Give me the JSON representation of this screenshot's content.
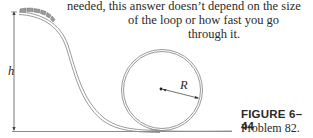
{
  "text": {
    "lines": [
      "needed, this answer doesn’t depend on the size",
      "of the loop or how fast you go",
      "through it."
    ]
  },
  "figure": {
    "labels": {
      "height": "h",
      "radius": "R"
    },
    "caption": {
      "title": "FIGURE 6–44",
      "subtitle": "Problem 82."
    }
  }
}
